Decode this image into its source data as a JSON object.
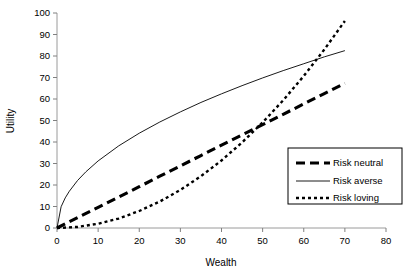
{
  "chart_data": {
    "type": "line",
    "title": "",
    "xlabel": "Wealth",
    "ylabel": "Utility",
    "xlim": [
      0,
      80
    ],
    "ylim": [
      0,
      100
    ],
    "xticks": [
      "0",
      "10",
      "20",
      "30",
      "40",
      "50",
      "60",
      "70",
      "80"
    ],
    "yticks": [
      "0",
      "10",
      "20",
      "30",
      "40",
      "50",
      "60",
      "70",
      "80",
      "90",
      "100"
    ],
    "grid": false,
    "legend_position": "center-right",
    "series": [
      {
        "name": "Risk neutral",
        "style": "thick-dashed",
        "color": "#000000",
        "x": [
          0,
          5,
          10,
          15,
          20,
          25,
          30,
          35,
          40,
          45,
          50,
          55,
          60,
          65,
          70
        ],
        "values": [
          0,
          4.8,
          9.6,
          14.4,
          19.2,
          24.1,
          28.9,
          33.7,
          38.5,
          43.3,
          48.1,
          52.9,
          57.7,
          62.5,
          67.3
        ]
      },
      {
        "name": "Risk averse",
        "style": "thin-solid",
        "color": "#000000",
        "x": [
          0,
          1,
          2,
          3,
          5,
          7,
          10,
          15,
          20,
          25,
          30,
          35,
          40,
          45,
          50,
          55,
          60,
          65,
          70
        ],
        "values": [
          0,
          9.9,
          14.0,
          17.1,
          22.1,
          26.1,
          31.2,
          38.2,
          44.1,
          49.3,
          54.0,
          58.4,
          62.4,
          66.2,
          69.8,
          73.2,
          76.4,
          79.6,
          82.5
        ]
      },
      {
        "name": "Risk loving",
        "style": "dotted",
        "color": "#000000",
        "x": [
          0,
          5,
          10,
          15,
          20,
          25,
          30,
          35,
          40,
          45,
          50,
          55,
          60,
          65,
          70
        ],
        "values": [
          0,
          0.5,
          2.0,
          4.4,
          7.9,
          12.3,
          17.7,
          24.1,
          31.4,
          39.8,
          49.1,
          59.4,
          70.7,
          83.0,
          96.3
        ]
      }
    ]
  },
  "legend": {
    "items": [
      {
        "label": "Risk neutral"
      },
      {
        "label": "Risk averse"
      },
      {
        "label": "Risk loving"
      }
    ]
  },
  "axes": {
    "x_title": "Wealth",
    "y_title": "Utility"
  },
  "colors": {
    "axis": "#808080",
    "series": "#000000",
    "background": "#ffffff"
  }
}
